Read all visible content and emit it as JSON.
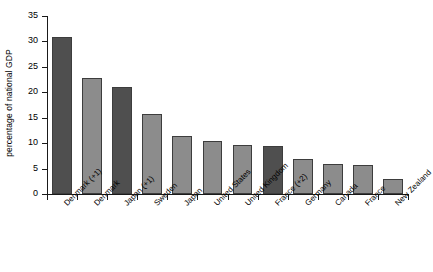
{
  "chart_data": {
    "type": "bar",
    "title": "",
    "xlabel": "",
    "ylabel": "percentage of national GDP",
    "ylim": [
      0,
      35
    ],
    "yticks": [
      0,
      5,
      10,
      15,
      20,
      25,
      30,
      35
    ],
    "ytick_labels": [
      "0",
      "5",
      "10",
      "15",
      "20",
      "25",
      "30",
      "35"
    ],
    "grid": false,
    "legend": null,
    "categories": [
      "Denmark (+1)",
      "Denmark",
      "Japan (+1)",
      "Sweden",
      "Japan",
      "United States",
      "United Kingdom",
      "France (+2)",
      "Germany",
      "Canada",
      "France",
      "New Zealand"
    ],
    "values": [
      30.8,
      22.8,
      21.1,
      15.8,
      11.4,
      10.5,
      9.6,
      9.4,
      6.8,
      6.0,
      5.8,
      3.0
    ],
    "bar_colors": [
      "#4f4f4f",
      "#8c8c8c",
      "#4f4f4f",
      "#8c8c8c",
      "#8c8c8c",
      "#8c8c8c",
      "#8c8c8c",
      "#4f4f4f",
      "#8c8c8c",
      "#8c8c8c",
      "#8c8c8c",
      "#8c8c8c"
    ],
    "colors": {
      "dark_bar": "#4f4f4f",
      "light_bar": "#8c8c8c",
      "bar_edge": "#3d3d3d",
      "axis": "#1a1a1a",
      "background": "#ffffff",
      "text": "#000000"
    }
  }
}
